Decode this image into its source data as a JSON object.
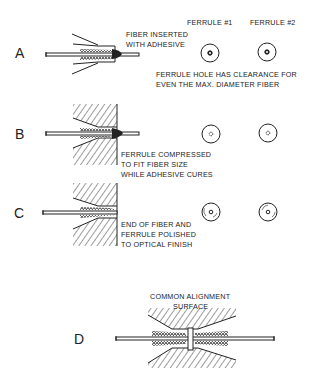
{
  "header": {
    "ferrule1": "FERRULE #1",
    "ferrule2": "FERRULE #2"
  },
  "steps": [
    {
      "letter": "A",
      "caption_lines": [
        "FIBER INSERTED",
        "WITH ADHESIVE"
      ],
      "note_lines": [
        "FERRULE HOLE HAS CLEARANCE FOR",
        "EVEN THE MAX. DIAMETER FIBER"
      ],
      "end_view": "clearance-hole"
    },
    {
      "letter": "B",
      "caption_lines": [
        "FERRULE COMPRESSED",
        "TO FIT FIBER SIZE",
        "WHILE ADHESIVE CURES"
      ],
      "end_view": "compressed-hole"
    },
    {
      "letter": "C",
      "caption_lines": [
        "END OF FIBER AND",
        "FERRULE POLISHED",
        "TO OPTICAL FINISH"
      ],
      "end_view": "polished-face"
    },
    {
      "letter": "D",
      "caption_lines": [
        "COMMON ALIGNMENT",
        "SURFACE"
      ],
      "end_view": "none"
    }
  ],
  "colors": {
    "ink": "#222222",
    "background": "#ffffff"
  }
}
